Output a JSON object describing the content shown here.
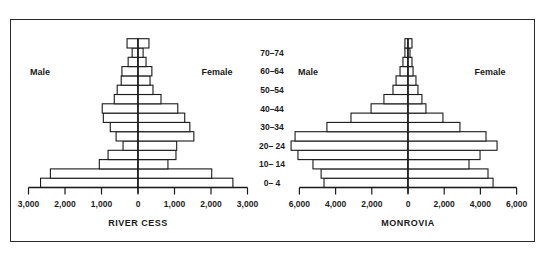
{
  "chart_data": [
    {
      "type": "bar",
      "subtype": "population-pyramid",
      "title": "RIVER CESS",
      "left_label": "Male",
      "right_label": "Female",
      "age_groups": [
        "0-4",
        "5-9",
        "10-14",
        "15-19",
        "20-24",
        "25-29",
        "30-34",
        "35-39",
        "40-44",
        "45-49",
        "50-54",
        "55-59",
        "60-64",
        "65-69",
        "70-74",
        "75+"
      ],
      "age_tick_labels": [
        "0– 4",
        "10– 14",
        "20– 24",
        "30–34",
        "40–44",
        "50–54",
        "60–64",
        "70–74"
      ],
      "series": [
        {
          "name": "Male",
          "values": [
            2670,
            2400,
            1060,
            820,
            410,
            600,
            760,
            950,
            980,
            650,
            570,
            460,
            440,
            270,
            160,
            300
          ]
        },
        {
          "name": "Female",
          "values": [
            2600,
            2020,
            820,
            1040,
            1060,
            1530,
            1420,
            1280,
            1090,
            630,
            410,
            330,
            380,
            220,
            140,
            300
          ]
        }
      ],
      "x_ticks": [
        "3,000",
        "2,000",
        "1,000",
        "0",
        "1,000",
        "2,000",
        "3,000"
      ],
      "xlim": [
        -3000,
        3000
      ],
      "grid": false
    },
    {
      "type": "bar",
      "subtype": "population-pyramid",
      "title": "MONROVIA",
      "left_label": "Male",
      "right_label": "Female",
      "age_groups": [
        "0-4",
        "5-9",
        "10-14",
        "15-19",
        "20-24",
        "25-29",
        "30-34",
        "35-39",
        "40-44",
        "45-49",
        "50-54",
        "55-59",
        "60-64",
        "65-69",
        "70-74",
        "75+"
      ],
      "series": [
        {
          "name": "Male",
          "values": [
            4640,
            4800,
            5250,
            6080,
            6460,
            6240,
            4480,
            3150,
            2040,
            1330,
            830,
            660,
            440,
            280,
            170,
            170
          ]
        },
        {
          "name": "Female",
          "values": [
            4700,
            4420,
            3370,
            3980,
            4920,
            4310,
            2870,
            1930,
            990,
            770,
            550,
            440,
            280,
            220,
            110,
            220
          ]
        }
      ],
      "x_ticks": [
        "6,000",
        "4,000",
        "2,000",
        "0",
        "2,000",
        "4,000",
        "6,000"
      ],
      "xlim": [
        -6000,
        6000
      ],
      "grid": false
    }
  ],
  "labels": {
    "left_title": "RIVER CESS",
    "right_title": "MONROVIA",
    "male": "Male",
    "female": "Female"
  },
  "colors": {
    "line": "#1a1a1a",
    "bar_fill": "#ffffff"
  }
}
